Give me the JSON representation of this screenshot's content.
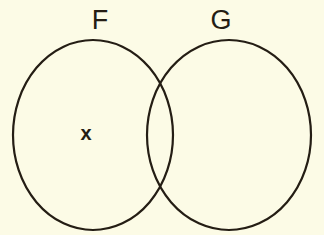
{
  "figure": {
    "type": "venn-diagram",
    "background_color": "#fcfbe6",
    "stroke_color": "#241d14",
    "text_color": "#241d14",
    "stroke_width": 2.2,
    "width": 324,
    "height": 235
  },
  "sets": [
    {
      "id": "F",
      "label": "F",
      "label_x": 100,
      "label_y": 22,
      "center_x": 93,
      "center_y": 135,
      "radius_x": 80,
      "radius_y": 95
    },
    {
      "id": "G",
      "label": "G",
      "label_x": 221,
      "label_y": 22,
      "center_x": 229,
      "center_y": 135,
      "radius_x": 82,
      "radius_y": 95
    }
  ],
  "elements": [
    {
      "id": "x",
      "label": "x",
      "x": 86,
      "y": 135,
      "region": "F-only"
    }
  ]
}
